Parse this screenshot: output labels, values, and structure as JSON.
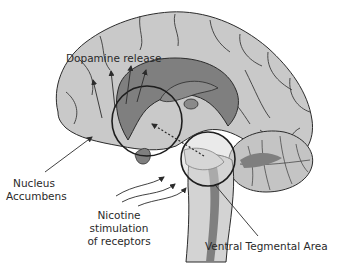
{
  "diagram": {
    "colors": {
      "cortex": "#c9c9c9",
      "inner_dark": "#7f7f7f",
      "stem_light": "#d3d3d3",
      "outline": "#2b2b2b",
      "background": "#ffffff"
    },
    "labels": {
      "dopamine_release": "Dopamine release",
      "nucleus_accumbens_line1": "Nucleus",
      "nucleus_accumbens_line2": "Accumbens",
      "nicotine_line1": "Nicotine",
      "nicotine_line2": "stimulation",
      "nicotine_line3": "of receptors",
      "ventral_tegmental_area": "Ventral Tegmental Area"
    },
    "regions": [
      {
        "name": "Nucleus Accumbens",
        "shape": "circle",
        "center": [
          147,
          121
        ],
        "radius": 35
      },
      {
        "name": "Ventral Tegmental Area",
        "shape": "circle",
        "center": [
          208,
          159
        ],
        "radius": 27
      }
    ],
    "arrows": {
      "dopamine_release_count": 4,
      "nicotine_stimulation_count": 3,
      "pathway": "dotted line from VTA to Nucleus Accumbens"
    }
  }
}
